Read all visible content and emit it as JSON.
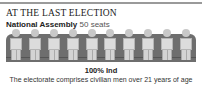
{
  "section": {
    "heading": "AT THE LAST ELECTION",
    "chamber": "National Assembly",
    "seats_label": "50 seats"
  },
  "seat_figures": 10,
  "result": "100% Ind",
  "note": "The electorate comprises civilian men over 21 years of age",
  "chart_data": {
    "type": "pie",
    "title": "National Assembly 50 seats",
    "categories": [
      "Ind"
    ],
    "values": [
      100
    ],
    "unit": "%",
    "total_seats": 50
  }
}
